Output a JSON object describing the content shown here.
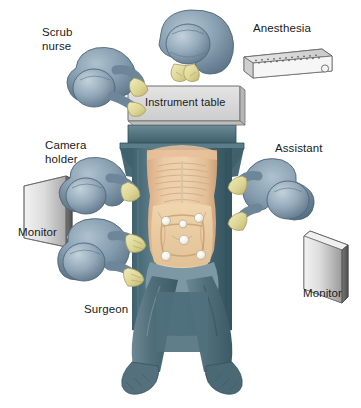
{
  "figure": {
    "type": "operating-room-layout-diagram",
    "view": "overhead",
    "background_color": "#ffffff"
  },
  "labels": {
    "scrub_nurse": "Scrub\nnurse",
    "anesthesia": "Anesthesia",
    "instrument_table": "Instrument table",
    "camera_holder": "Camera\nholder",
    "assistant": "Assistant",
    "monitor_left": "Monitor",
    "monitor_right": "Monitor",
    "surgeon": "Surgeon"
  },
  "colors": {
    "scrubs": "#7d94a8",
    "scrubs_dark": "#5d7588",
    "scrubs_light": "#a8bcca",
    "glove": "#e2dc9e",
    "glove_shade": "#c9c07a",
    "drape": "#4a6b77",
    "drape_dark": "#35555f",
    "drape_light": "#6c8a95",
    "skin": "#e8c4a0",
    "skin_shade": "#d4a882",
    "bone": "#e8dcb8",
    "monitor": "#d8d8d8",
    "monitor_dark": "#8f8f8f",
    "table_box": "#d6d6d6",
    "text": "#1a1a1a",
    "outline": "#4a4a4a"
  },
  "personnel": [
    {
      "name": "anesthesiologist",
      "position": "head-of-table-top",
      "label_key": "anesthesia"
    },
    {
      "name": "scrub-nurse",
      "position": "upper-left",
      "label_key": "scrub_nurse"
    },
    {
      "name": "camera-holder",
      "position": "mid-left",
      "label_key": "camera_holder"
    },
    {
      "name": "surgeon",
      "position": "lower-left",
      "label_key": "surgeon"
    },
    {
      "name": "assistant",
      "position": "mid-right",
      "label_key": "assistant"
    }
  ],
  "equipment": [
    {
      "name": "anesthesia-machine",
      "position": "top-right"
    },
    {
      "name": "instrument-table",
      "position": "upper-center"
    },
    {
      "name": "monitor-left",
      "position": "mid-left-edge"
    },
    {
      "name": "monitor-right",
      "position": "lower-right-edge"
    },
    {
      "name": "operating-table",
      "position": "center"
    }
  ],
  "patient": {
    "position": "lithotomy",
    "anatomy_shown": [
      "rib-cage",
      "abdomen",
      "colon",
      "trocar-port-sites"
    ],
    "port_count": 6
  }
}
